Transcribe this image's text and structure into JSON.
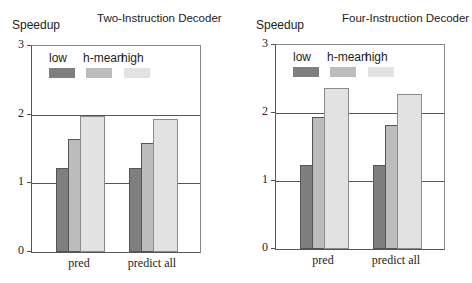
{
  "chart_data": [
    {
      "type": "bar",
      "title": "Two-Instruction Decoder",
      "xlabel": "",
      "ylabel": "Speedup",
      "ylim": [
        0,
        3
      ],
      "yticks": [
        "0",
        "1",
        "2",
        "3"
      ],
      "grid": true,
      "legend_position": "top-left inside",
      "categories": [
        "pred",
        "predict all"
      ],
      "series": [
        {
          "name": "low",
          "values": [
            1.22,
            1.22
          ],
          "color": "#7f7f7f"
        },
        {
          "name": "h-mean",
          "values": [
            1.64,
            1.59
          ],
          "color": "#bcbcbc"
        },
        {
          "name": "high",
          "values": [
            1.98,
            1.93
          ],
          "color": "#e2e2e2"
        }
      ]
    },
    {
      "type": "bar",
      "title": "Four-Instruction Decoder",
      "xlabel": "",
      "ylabel": "Speedup",
      "ylim": [
        0,
        3
      ],
      "yticks": [
        "0",
        "1",
        "2",
        "3"
      ],
      "grid": true,
      "legend_position": "top-left inside",
      "categories": [
        "pred",
        "predict all"
      ],
      "series": [
        {
          "name": "low",
          "values": [
            1.24,
            1.24
          ],
          "color": "#7f7f7f"
        },
        {
          "name": "h-mean",
          "values": [
            1.94,
            1.82
          ],
          "color": "#bcbcbc"
        },
        {
          "name": "high",
          "values": [
            2.37,
            2.28
          ],
          "color": "#e2e2e2"
        }
      ]
    }
  ]
}
